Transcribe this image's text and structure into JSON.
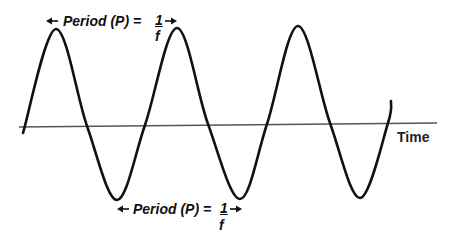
{
  "diagram": {
    "colors": {
      "wave": "#111111",
      "axis": "#555555",
      "text": "#111111",
      "background": "#ffffff"
    },
    "axis": {
      "label": "Time",
      "x1": 19,
      "y1": 127,
      "x2": 437,
      "y2": 123
    },
    "wave": {
      "points": [
        [
          23,
          133
        ],
        [
          56,
          29
        ],
        [
          87,
          126
        ],
        [
          117,
          200
        ],
        [
          145,
          125
        ],
        [
          177,
          28
        ],
        [
          208,
          124
        ],
        [
          240,
          199
        ],
        [
          267,
          124
        ],
        [
          298,
          26
        ],
        [
          330,
          123
        ],
        [
          360,
          198
        ],
        [
          388,
          123
        ],
        [
          391,
          101
        ]
      ]
    },
    "top_label": {
      "text": "Period (P) =",
      "numerator": "1",
      "denominator": "f",
      "arrow_left_x": 46,
      "arrow_right_x": 177,
      "y": 21
    },
    "bottom_label": {
      "text": "Period (P) =",
      "numerator": "1",
      "denominator": "f",
      "arrow_left_x": 117,
      "arrow_right_x": 242,
      "y": 209
    }
  }
}
